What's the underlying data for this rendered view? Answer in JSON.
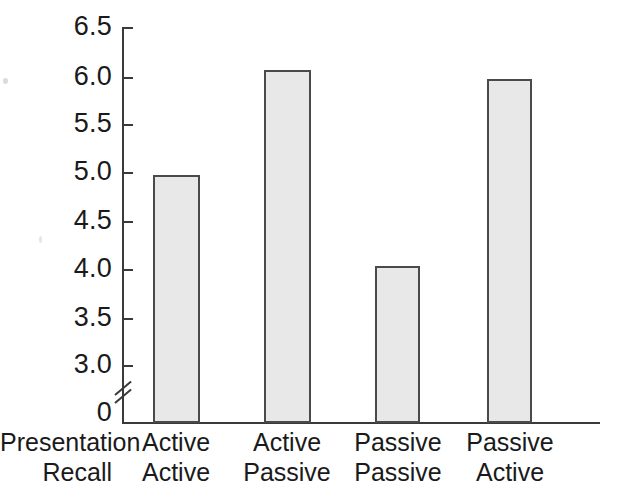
{
  "chart_data": {
    "type": "bar",
    "title": "",
    "xlabel": "",
    "ylabel": "",
    "categories": [
      "Active\nActive",
      "Active\nPassive",
      "Passive\nPassive",
      "Passive\nActive"
    ],
    "series": [
      {
        "name": "Mean recall",
        "values": [
          4.97,
          6.05,
          4.02,
          5.96
        ]
      }
    ],
    "bars": [
      {
        "presentation": "Active",
        "recall": "Active",
        "value": 4.97
      },
      {
        "presentation": "Active",
        "recall": "Passive",
        "value": 6.05
      },
      {
        "presentation": "Passive",
        "recall": "Passive",
        "value": 4.02
      },
      {
        "presentation": "Passive",
        "recall": "Active",
        "value": 5.96
      }
    ],
    "ylim": [
      3.0,
      6.5
    ],
    "y_axis_has_break": true,
    "y_break_from": 0,
    "y_break_to": 3.0,
    "yticks": [
      "0",
      "3.0",
      "3.5",
      "4.0",
      "4.5",
      "5.0",
      "5.5",
      "6.0",
      "6.5"
    ],
    "grid": false,
    "legend": "none",
    "bar_fill_color": "#e8e8e8",
    "bar_edge_color": "#4a4a4a",
    "axis_color": "#3a3a3a"
  },
  "axis": {
    "ticks": [
      {
        "label": "6.5",
        "value": 6.5
      },
      {
        "label": "6.0",
        "value": 6.0
      },
      {
        "label": "5.5",
        "value": 5.5
      },
      {
        "label": "5.0",
        "value": 5.0
      },
      {
        "label": "4.5",
        "value": 4.5
      },
      {
        "label": "4.0",
        "value": 4.0
      },
      {
        "label": "3.5",
        "value": 3.5
      },
      {
        "label": "3.0",
        "value": 3.0
      },
      {
        "label": "0",
        "value": 0
      }
    ]
  },
  "x_axis": {
    "row_headers": [
      "Presentation",
      "Recall"
    ],
    "columns": [
      {
        "presentation": "Active",
        "recall": "Active"
      },
      {
        "presentation": "Active",
        "recall": "Passive"
      },
      {
        "presentation": "Passive",
        "recall": "Passive"
      },
      {
        "presentation": "Passive",
        "recall": "Active"
      }
    ]
  }
}
